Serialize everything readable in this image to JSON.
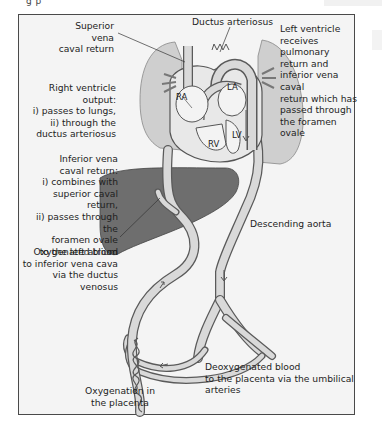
{
  "figure": {
    "title_fragment": "g   p",
    "labels": {
      "superior_vena_caval_return": "Superior\nvena\ncaval return",
      "ductus_arteriosus": "Ductus arteriosus",
      "left_ventricle": "Left ventricle\nreceives pulmonary\nreturn and\ninferior vena caval\nreturn which has\npassed through\nthe foramen ovale",
      "right_ventricle_output": "Right ventricle\noutput:\ni) passes to lungs,\nii) through the\nductus arteriosus",
      "inferior_vena_caval_return": "Inferior vena\ncaval return:\ni) combines with\nsuperior caval return,\nii) passes through the\nforamen ovale\nto the left atrium",
      "oxygenated_blood": "Oxygenated blood\nto inferior vena cava\nvia the ductus venosus",
      "descending_aorta": "Descending aorta",
      "deoxygenated_blood": "Deoxygenated blood\nto the placenta via the umbilical arteries",
      "oxygenation_placenta": "Oxygenation in\nthe placenta"
    },
    "chambers": {
      "ra": "RA",
      "la": "LA",
      "rv": "RV",
      "lv": "LV"
    },
    "colors": {
      "frame_bg": "#f4f4f4",
      "frame_border": "#4a4a4a",
      "lung": "#cfcfcf",
      "liver": "#6e6e6e",
      "vessel_fill": "#d9d9d9",
      "vessel_stroke": "#5a5a5a",
      "heart_fill": "#e8e8e8"
    }
  }
}
